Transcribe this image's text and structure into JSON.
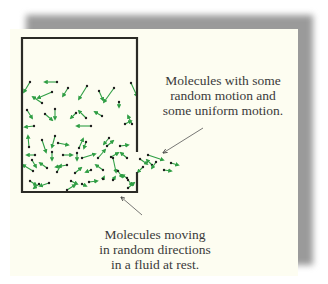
{
  "figure": {
    "colors": {
      "card_background": "#fdfdf1",
      "shadow": "#9a9a9a",
      "container_wall": "#2b2b26",
      "arrow_green": "#2f9e44",
      "molecule_dot": "#1e1e1e",
      "leader_line": "#555555"
    },
    "container": {
      "left": 22,
      "top": 38,
      "right": 137,
      "bottom": 192,
      "opening": {
        "side": "right",
        "from_y": 152,
        "to_y": 172
      }
    },
    "labels": {
      "top_right": {
        "lines": [
          "Molecules with some",
          "random motion and",
          "some uniform motion."
        ]
      },
      "bottom": {
        "lines": [
          "Molecules moving",
          "in random directions",
          "in a fluid at rest."
        ]
      }
    },
    "leaders": [
      {
        "name": "uniform-motion-leader",
        "x1": 203,
        "y1": 128,
        "x2": 163,
        "y2": 153
      },
      {
        "name": "random-motion-leader",
        "x1": 142,
        "y1": 215,
        "x2": 121,
        "y2": 197
      }
    ],
    "molecules": [
      [
        30,
        82,
        24,
        92
      ],
      [
        57,
        82,
        45,
        82
      ],
      [
        52,
        92,
        38,
        98
      ],
      [
        42,
        103,
        33,
        97
      ],
      [
        68,
        88,
        63,
        96
      ],
      [
        87,
        86,
        79,
        99
      ],
      [
        99,
        91,
        103,
        100
      ],
      [
        114,
        88,
        104,
        102
      ],
      [
        131,
        83,
        137,
        96
      ],
      [
        119,
        102,
        119,
        107
      ],
      [
        27,
        110,
        32,
        118
      ],
      [
        45,
        114,
        52,
        120
      ],
      [
        55,
        109,
        55,
        119
      ],
      [
        76,
        113,
        71,
        118
      ],
      [
        86,
        118,
        79,
        111
      ],
      [
        102,
        116,
        95,
        112
      ],
      [
        132,
        124,
        128,
        116
      ],
      [
        34,
        126,
        25,
        127
      ],
      [
        91,
        126,
        77,
        126
      ],
      [
        125,
        124,
        131,
        121
      ],
      [
        29,
        147,
        28,
        136
      ],
      [
        42,
        140,
        46,
        152
      ],
      [
        58,
        143,
        68,
        145
      ],
      [
        55,
        136,
        52,
        147
      ],
      [
        86,
        142,
        84,
        148
      ],
      [
        79,
        148,
        83,
        139
      ],
      [
        109,
        138,
        104,
        144
      ],
      [
        107,
        146,
        113,
        141
      ],
      [
        120,
        146,
        128,
        145
      ],
      [
        35,
        155,
        27,
        155
      ],
      [
        52,
        152,
        52,
        160
      ],
      [
        63,
        155,
        72,
        155
      ],
      [
        77,
        153,
        77,
        160
      ],
      [
        82,
        158,
        95,
        154
      ],
      [
        98,
        158,
        105,
        150
      ],
      [
        111,
        157,
        118,
        153
      ],
      [
        127,
        158,
        121,
        153
      ],
      [
        32,
        160,
        36,
        167
      ],
      [
        33,
        171,
        23,
        165
      ],
      [
        47,
        168,
        40,
        163
      ],
      [
        57,
        172,
        61,
        165
      ],
      [
        67,
        165,
        56,
        167
      ],
      [
        75,
        173,
        81,
        168
      ],
      [
        91,
        170,
        86,
        172
      ],
      [
        103,
        170,
        96,
        165
      ],
      [
        113,
        158,
        116,
        172
      ],
      [
        118,
        171,
        122,
        177
      ],
      [
        127,
        178,
        122,
        175
      ],
      [
        30,
        181,
        36,
        185
      ],
      [
        39,
        184,
        34,
        188
      ],
      [
        49,
        183,
        40,
        186
      ],
      [
        71,
        181,
        77,
        184
      ],
      [
        82,
        184,
        86,
        186
      ],
      [
        89,
        182,
        97,
        181
      ],
      [
        103,
        179,
        104,
        177
      ],
      [
        113,
        180,
        115,
        177
      ],
      [
        128,
        180,
        132,
        185
      ],
      [
        67,
        190,
        75,
        185
      ],
      [
        128,
        188,
        134,
        183
      ],
      [
        140,
        159,
        147,
        164
      ],
      [
        143,
        167,
        138,
        172
      ],
      [
        152,
        165,
        147,
        160
      ],
      [
        148,
        155,
        163,
        160
      ],
      [
        171,
        163,
        178,
        165
      ],
      [
        164,
        170,
        171,
        171
      ],
      [
        156,
        162,
        152,
        168
      ]
    ]
  }
}
